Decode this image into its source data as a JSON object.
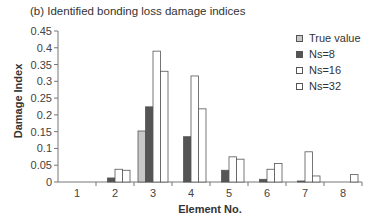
{
  "chart_data": {
    "type": "bar",
    "title": "(b) Identified bonding loss damage indices",
    "xlabel": "Element No.",
    "ylabel": "Damage Index",
    "ylim": [
      0,
      0.45
    ],
    "yticks": [
      "0",
      "0.05",
      "0.1",
      "0.15",
      "0.2",
      "0.25",
      "0.3",
      "0.35",
      "0.4",
      "0.45"
    ],
    "categories": [
      "1",
      "2",
      "3",
      "4",
      "5",
      "6",
      "7",
      "8"
    ],
    "grid": false,
    "legend_position": "right",
    "series": [
      {
        "name": "True value",
        "color": "#c8c8c8",
        "values": [
          0,
          0,
          0.152,
          0,
          0,
          0,
          0,
          0
        ]
      },
      {
        "name": "Ns=8",
        "color": "#555555",
        "values": [
          0,
          0.012,
          0.224,
          0.135,
          0.035,
          0.008,
          0.003,
          0
        ]
      },
      {
        "name": "Ns=16",
        "color": "#ffffff",
        "values": [
          0,
          0.038,
          0.39,
          0.316,
          0.075,
          0.038,
          0.09,
          0
        ]
      },
      {
        "name": "Ns=32",
        "color": "#ffffff",
        "values": [
          0,
          0.035,
          0.33,
          0.218,
          0.068,
          0.055,
          0.018,
          0.022
        ]
      }
    ]
  }
}
